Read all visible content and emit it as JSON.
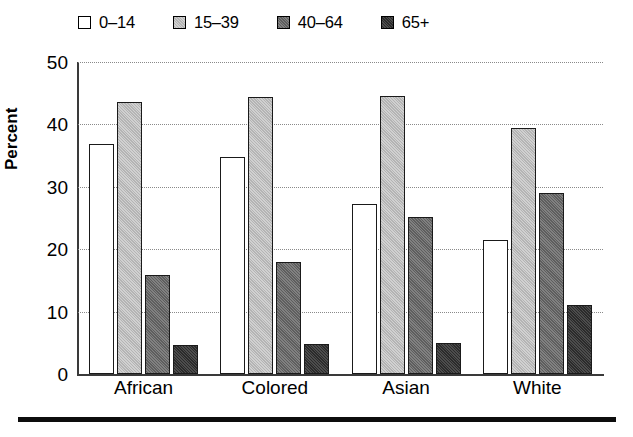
{
  "chart_data": {
    "type": "bar",
    "title": "",
    "xlabel": "",
    "ylabel": "Percent",
    "categories": [
      "African",
      "Colored",
      "Asian",
      "White"
    ],
    "series": [
      {
        "name": "0–14",
        "color": "#ffffff",
        "values": [
          36.8,
          34.7,
          27.2,
          21.5
        ]
      },
      {
        "name": "15–39",
        "color": "#b4b4b4",
        "values": [
          43.6,
          44.4,
          44.5,
          39.5
        ]
      },
      {
        "name": "40–64",
        "color": "#5e5e5e",
        "values": [
          15.8,
          17.9,
          25.2,
          29.0
        ]
      },
      {
        "name": "65+",
        "color": "#2b2b2b",
        "values": [
          4.7,
          4.8,
          5.0,
          11.0
        ]
      }
    ],
    "ylim": [
      0,
      50
    ],
    "yticks": [
      0,
      10,
      20,
      30,
      40,
      50
    ],
    "ytick_labels": [
      "0",
      "10",
      "20",
      "30",
      "40",
      "50"
    ],
    "grid": true,
    "grid_axis": "y",
    "grid_style": "dotted",
    "legend_position": "top-left",
    "bar_edge_color": "#1a1a1a",
    "axis_color": "#3a3a3a"
  },
  "figure": {
    "bottom_rule_color": "#0d0d0d",
    "background": "#ffffff"
  }
}
